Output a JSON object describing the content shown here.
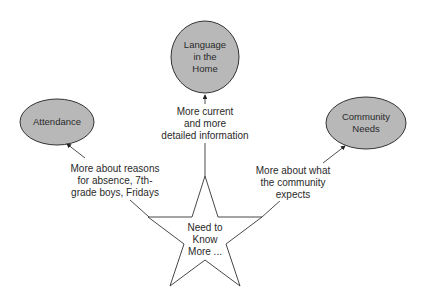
{
  "diagram": {
    "center": {
      "label_lines": [
        "Need to",
        "Know",
        "More ..."
      ],
      "shape": "star"
    },
    "nodes": [
      {
        "id": "language",
        "label_lines": [
          "Language",
          "in the",
          "Home"
        ],
        "shape": "ellipse",
        "fill": "#b8b8b8"
      },
      {
        "id": "attendance",
        "label_lines": [
          "Attendance"
        ],
        "shape": "ellipse",
        "fill": "#b8b8b8"
      },
      {
        "id": "community",
        "label_lines": [
          "Community",
          "Needs"
        ],
        "shape": "ellipse",
        "fill": "#b8b8b8"
      }
    ],
    "edges": [
      {
        "from": "center",
        "to": "language",
        "label_lines": [
          "More current",
          "and more",
          "detailed information"
        ]
      },
      {
        "from": "center",
        "to": "attendance",
        "label_lines": [
          "More about reasons",
          "for absence, 7th-",
          "grade boys, Fridays"
        ]
      },
      {
        "from": "center",
        "to": "community",
        "label_lines": [
          "More about what",
          "the community",
          "expects"
        ]
      }
    ]
  }
}
